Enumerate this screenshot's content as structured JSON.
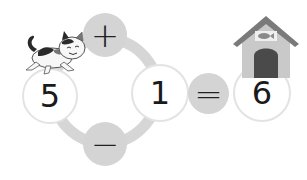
{
  "equation": {
    "operand_a": "5",
    "operand_b": "1",
    "result": "6",
    "operator_top": "+",
    "operator_bottom": "−",
    "equals": "="
  },
  "decorations": {
    "left_character": "cat-icon",
    "right_destination": "doghouse-icon",
    "house_sign": "fish-icon"
  },
  "colors": {
    "operator_circle": "#d4d4d4",
    "ring": "#d6d6d6",
    "number_circle_border": "#e3e3e3",
    "text": "#1a1a1a"
  }
}
